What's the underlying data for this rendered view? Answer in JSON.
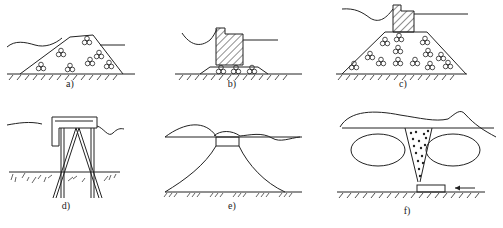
{
  "figure": {
    "panels": [
      {
        "id": "a",
        "label": "a)",
        "description": "rubble-mound breakwater",
        "x": 70,
        "y": 78
      },
      {
        "id": "b",
        "label": "b)",
        "description": "caisson structure on rubble bedding",
        "x": 232,
        "y": 78
      },
      {
        "id": "c",
        "label": "c)",
        "description": "composite breakwater with caisson on rubble mound",
        "x": 403,
        "y": 78
      },
      {
        "id": "d",
        "label": "d)",
        "description": "pile-supported jacket platform",
        "x": 66,
        "y": 200
      },
      {
        "id": "e",
        "label": "e)",
        "description": "artificial island with sloped fill",
        "x": 232,
        "y": 200
      },
      {
        "id": "f",
        "label": "f)",
        "description": "sand fill with conveyor pipe",
        "x": 407,
        "y": 205
      }
    ],
    "colors": {
      "line": "#222222",
      "background": "#ffffff"
    }
  }
}
